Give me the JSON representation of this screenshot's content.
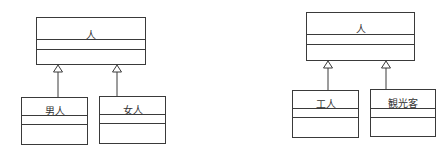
{
  "diagrams": [
    {
      "parent": {
        "name": "人"
      },
      "children": [
        {
          "name": "男人"
        },
        {
          "name": "女人"
        }
      ]
    },
    {
      "parent": {
        "name": "人"
      },
      "children": [
        {
          "name": "工人"
        },
        {
          "name": "観光客"
        }
      ]
    }
  ],
  "relationship": "generalization",
  "colors": {
    "line": "#3a3a3a",
    "background": "#ffffff"
  }
}
